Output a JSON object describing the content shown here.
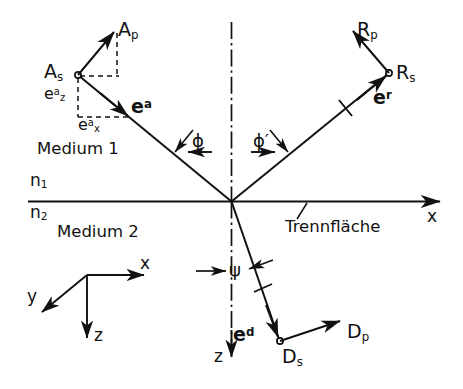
{
  "figure": {
    "type": "optics-ray-diagram",
    "width": 463,
    "height": 389,
    "background_color": "#ffffff",
    "line_color": "#111111"
  },
  "media": {
    "upper_label": "Medium 1",
    "lower_label": "Medium 2",
    "index_upper": "n",
    "index_upper_sub": "1",
    "index_lower": "n",
    "index_lower_sub": "2",
    "interface_label": "Trennfläche"
  },
  "axes": {
    "x_label": "x",
    "z_label": "z",
    "y_label": "y",
    "triad_x": "x",
    "triad_y": "y",
    "triad_z": "z"
  },
  "angles": {
    "incidence": "ϕ",
    "reflection": "ϕ′",
    "refraction": "ψ"
  },
  "incident": {
    "amplitude_s": "A",
    "amplitude_s_sub": "s",
    "amplitude_p": "A",
    "amplitude_p_sub": "p",
    "unit_vector": "e",
    "unit_vector_sup": "a",
    "comp_z": "e",
    "comp_z_sub": "z",
    "comp_z_sup": "a",
    "comp_x": "e",
    "comp_x_sub": "x",
    "comp_x_sup": "a"
  },
  "reflected": {
    "amplitude_s": "R",
    "amplitude_s_sub": "s",
    "amplitude_p": "R",
    "amplitude_p_sub": "p",
    "unit_vector": "e",
    "unit_vector_sup": "r"
  },
  "refracted": {
    "amplitude_s": "D",
    "amplitude_s_sub": "s",
    "amplitude_p": "D",
    "amplitude_p_sub": "p",
    "unit_vector": "e",
    "unit_vector_sup": "d"
  }
}
